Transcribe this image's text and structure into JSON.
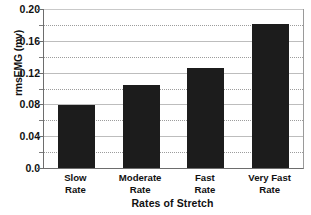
{
  "chart_data": {
    "type": "bar",
    "title": "",
    "categories": [
      "Slow\nRate",
      "Moderate\nRate",
      "Fast\nRate",
      "Very Fast\nRate"
    ],
    "values": [
      0.079,
      0.104,
      0.126,
      0.181
    ],
    "xlabel": "Rates of Stretch",
    "ylabel": "rmsEMG (mv)",
    "ylim": [
      0.0,
      0.2
    ],
    "ytick_labels": [
      "0.0",
      "0.04",
      "0.08",
      "0.12",
      "0.16",
      "0.20"
    ],
    "ytick_values": [
      0.0,
      0.04,
      0.08,
      0.12,
      0.16,
      0.2
    ],
    "yminor_values": [
      0.02,
      0.06,
      0.1,
      0.14,
      0.18
    ],
    "grid": "horizontal",
    "legend": "none",
    "bar_color": "#1c1c1c",
    "grid_color": "#9c9c9c",
    "axis_color": "#6d6d6d"
  }
}
